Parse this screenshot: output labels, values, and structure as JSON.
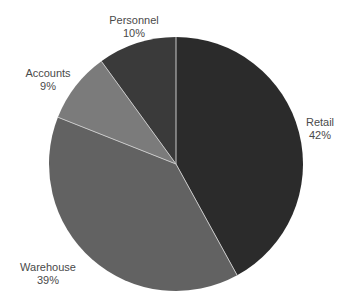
{
  "chart_data": {
    "type": "pie",
    "title": "",
    "categories": [
      "Retail",
      "Warehouse",
      "Accounts",
      "Personnel"
    ],
    "values": [
      42,
      39,
      9,
      10
    ],
    "labels": [
      "42%",
      "39%",
      "9%",
      "10%"
    ],
    "colors": [
      "#2b2b2b",
      "#626262",
      "#7b7b7b",
      "#3a3a3a"
    ],
    "start_angle_deg": 0,
    "direction": "clockwise",
    "legend": "none",
    "separator_color": "#c8c8c8"
  },
  "labels": {
    "retail": {
      "name": "Retail",
      "pct": "42%"
    },
    "warehouse": {
      "name": "Warehouse",
      "pct": "39%"
    },
    "accounts": {
      "name": "Accounts",
      "pct": "9%"
    },
    "personnel": {
      "name": "Personnel",
      "pct": "10%"
    }
  }
}
